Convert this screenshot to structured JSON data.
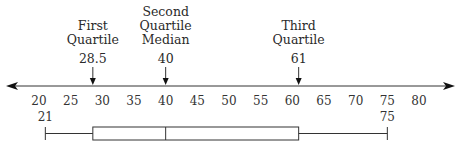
{
  "chart_data": {
    "type": "boxplot",
    "title": "",
    "axis": {
      "min": 20,
      "max": 80,
      "step": 5,
      "ticks": [
        "20",
        "25",
        "30",
        "35",
        "40",
        "45",
        "50",
        "55",
        "60",
        "65",
        "70",
        "75",
        "80"
      ],
      "arrows": "both-ends"
    },
    "five_number_summary": {
      "min": 21,
      "q1": 28.5,
      "median": 40,
      "q3": 61,
      "max": 75
    },
    "annotations": [
      {
        "key": "q1",
        "value": 28.5,
        "label_lines": [
          "First",
          "Quartile"
        ],
        "value_label": "28.5"
      },
      {
        "key": "median",
        "value": 40,
        "label_lines": [
          "Second",
          "Quartile",
          "Median"
        ],
        "value_label": "40"
      },
      {
        "key": "q3",
        "value": 61,
        "label_lines": [
          "Third",
          "Quartile"
        ],
        "value_label": "61"
      }
    ],
    "whisker_labels": [
      {
        "key": "min",
        "value": 21,
        "label": "21"
      },
      {
        "key": "max",
        "value": 75,
        "label": "75"
      }
    ]
  }
}
